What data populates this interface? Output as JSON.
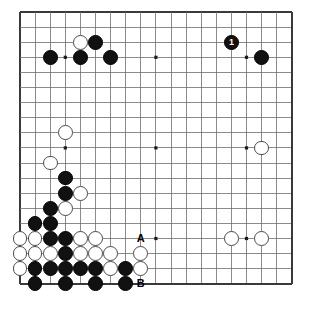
{
  "diagram": {
    "kind": "go-board-diagram",
    "board_size": 19,
    "geometry": {
      "origin_x": 20,
      "origin_y": 12,
      "spacing": 15.1,
      "stone_radius": 7.4,
      "line_color": "#6e6e6e",
      "border_color": "#3a3a3a",
      "background": "#ffffff",
      "black_color": "#111111",
      "white_color": "#ffffff",
      "white_edge_color": "#4a4a4a"
    },
    "star_points": [
      {
        "col": 3,
        "row": 3
      },
      {
        "col": 9,
        "row": 3
      },
      {
        "col": 15,
        "row": 3
      },
      {
        "col": 3,
        "row": 9
      },
      {
        "col": 9,
        "row": 9
      },
      {
        "col": 15,
        "row": 9
      },
      {
        "col": 3,
        "row": 15
      },
      {
        "col": 9,
        "row": 15
      },
      {
        "col": 15,
        "row": 15
      }
    ],
    "stones": [
      {
        "col": 4,
        "row": 2,
        "color": "white"
      },
      {
        "col": 5,
        "row": 2,
        "color": "black"
      },
      {
        "col": 2,
        "row": 3,
        "color": "black"
      },
      {
        "col": 4,
        "row": 3,
        "color": "black"
      },
      {
        "col": 6,
        "row": 3,
        "color": "black"
      },
      {
        "col": 16,
        "row": 3,
        "color": "black"
      },
      {
        "col": 3,
        "row": 8,
        "color": "white"
      },
      {
        "col": 16,
        "row": 9,
        "color": "white"
      },
      {
        "col": 2,
        "row": 10,
        "color": "white"
      },
      {
        "col": 3,
        "row": 11,
        "color": "black"
      },
      {
        "col": 3,
        "row": 12,
        "color": "black"
      },
      {
        "col": 4,
        "row": 12,
        "color": "white"
      },
      {
        "col": 2,
        "row": 13,
        "color": "black"
      },
      {
        "col": 3,
        "row": 13,
        "color": "white"
      },
      {
        "col": 1,
        "row": 14,
        "color": "black"
      },
      {
        "col": 2,
        "row": 14,
        "color": "black"
      },
      {
        "col": 0,
        "row": 15,
        "color": "white"
      },
      {
        "col": 1,
        "row": 15,
        "color": "white"
      },
      {
        "col": 2,
        "row": 15,
        "color": "black"
      },
      {
        "col": 3,
        "row": 15,
        "color": "black"
      },
      {
        "col": 4,
        "row": 15,
        "color": "white"
      },
      {
        "col": 5,
        "row": 15,
        "color": "white"
      },
      {
        "col": 14,
        "row": 15,
        "color": "white"
      },
      {
        "col": 16,
        "row": 15,
        "color": "white"
      },
      {
        "col": 0,
        "row": 16,
        "color": "white"
      },
      {
        "col": 1,
        "row": 16,
        "color": "white"
      },
      {
        "col": 2,
        "row": 16,
        "color": "white"
      },
      {
        "col": 3,
        "row": 16,
        "color": "black"
      },
      {
        "col": 4,
        "row": 16,
        "color": "white"
      },
      {
        "col": 5,
        "row": 16,
        "color": "white"
      },
      {
        "col": 6,
        "row": 16,
        "color": "white"
      },
      {
        "col": 8,
        "row": 16,
        "color": "white"
      },
      {
        "col": 0,
        "row": 17,
        "color": "white"
      },
      {
        "col": 1,
        "row": 17,
        "color": "black"
      },
      {
        "col": 2,
        "row": 17,
        "color": "black"
      },
      {
        "col": 3,
        "row": 17,
        "color": "black"
      },
      {
        "col": 4,
        "row": 17,
        "color": "black"
      },
      {
        "col": 5,
        "row": 17,
        "color": "black"
      },
      {
        "col": 6,
        "row": 17,
        "color": "white"
      },
      {
        "col": 7,
        "row": 17,
        "color": "black"
      },
      {
        "col": 8,
        "row": 17,
        "color": "white"
      },
      {
        "col": 1,
        "row": 18,
        "color": "black"
      },
      {
        "col": 3,
        "row": 18,
        "color": "black"
      },
      {
        "col": 5,
        "row": 18,
        "color": "black"
      },
      {
        "col": 7,
        "row": 18,
        "color": "black"
      }
    ],
    "numbered_stones": [
      {
        "col": 14,
        "row": 2,
        "color": "black",
        "number": "1"
      }
    ],
    "letter_labels": [
      {
        "col": 8,
        "row": 15,
        "text": "A"
      },
      {
        "col": 8,
        "row": 18,
        "text": "B"
      }
    ]
  }
}
